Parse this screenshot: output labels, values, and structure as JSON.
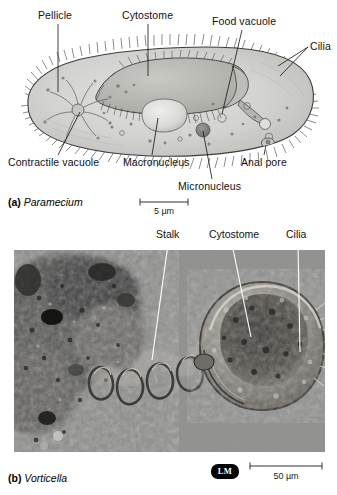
{
  "figure": {
    "background_color": "#ffffff"
  },
  "panel_a": {
    "caption_marker": "(a)",
    "caption_name": "Paramecium",
    "organism": "Paramecium",
    "body_fill_color": "#cfcfcd",
    "body_outline_color": "#333333",
    "labels": [
      {
        "id": "pellicle",
        "text": "Pellicle"
      },
      {
        "id": "cytostome",
        "text": "Cytostome"
      },
      {
        "id": "food-vacuole",
        "text": "Food vacuole"
      },
      {
        "id": "cilia",
        "text": "Cilia"
      },
      {
        "id": "contractile-vacuole",
        "text": "Contractile vacuole"
      },
      {
        "id": "macronucleus",
        "text": "Macronucleus"
      },
      {
        "id": "micronucleus",
        "text": "Micronucleus"
      },
      {
        "id": "anal-pore",
        "text": "Anal pore"
      }
    ],
    "scale_bar": {
      "value": "5",
      "unit": "µm",
      "text": "5 µm"
    }
  },
  "panel_b": {
    "caption_marker": "(b)",
    "caption_name": "Vorticella",
    "organism": "Vorticella",
    "micrograph_type_badge": "LM",
    "labels": [
      {
        "id": "stalk",
        "text": "Stalk"
      },
      {
        "id": "cytostome",
        "text": "Cytostome"
      },
      {
        "id": "cilia",
        "text": "Cilia"
      }
    ],
    "scale_bar": {
      "value": "50",
      "unit": "µm",
      "text": "50 µm"
    },
    "micrograph_colors": {
      "background": "#8a8a8a",
      "debris_dark": "#2a2a2a",
      "cell_body": "#9a968f"
    }
  }
}
